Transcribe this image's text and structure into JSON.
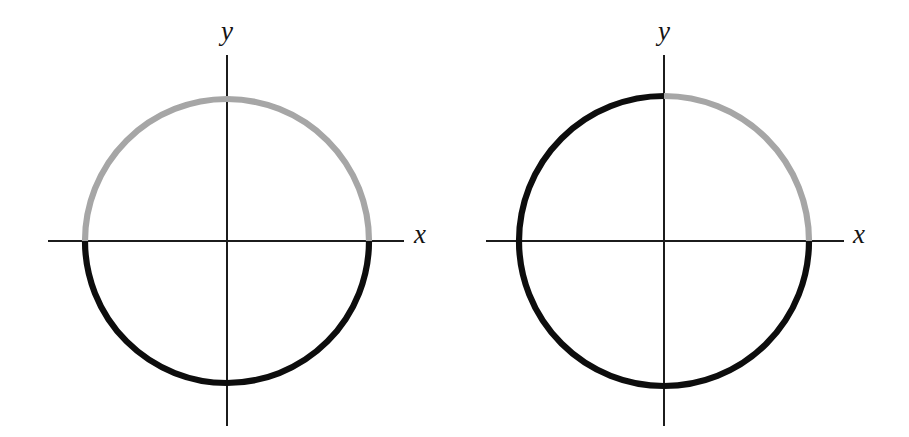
{
  "figure": {
    "background_color": "#ffffff",
    "width": 909,
    "height": 437,
    "stroke_colors": {
      "black_arc": "#0d0d0d",
      "gray_arc": "#a6a6a6",
      "axis": "#1c1c1c"
    },
    "arc_stroke_width": 6.2,
    "axis_stroke_width": 1.6
  },
  "chart_data": {
    "type": "line",
    "title": "",
    "xlabel": "x",
    "ylabel": "y",
    "grid": false,
    "legend": "none",
    "panels": [
      {
        "id": "left-panel",
        "name": "left-circle-diagram",
        "center": {
          "x": 227,
          "y": 241
        },
        "radius_x": 142,
        "radius_y": 142,
        "x_axis": {
          "x_start": 48,
          "x_end": 404,
          "y": 241
        },
        "y_axis": {
          "y_start": 55,
          "y_end": 426,
          "x": 227
        },
        "axis_labels": {
          "x": "x",
          "y": "y"
        },
        "x_label_pos": {
          "x": 414,
          "y": 233
        },
        "y_label_pos": {
          "x": 219,
          "y": 22
        },
        "arcs": [
          {
            "name": "gray-arc",
            "color": "#a6a6a6",
            "start_angle_deg": 0,
            "end_angle_deg": 180,
            "sweep_deg": 180,
            "description": "upper half of the circle, from (r,0) counterclockwise to (-r,0)"
          },
          {
            "name": "black-arc",
            "color": "#0d0d0d",
            "start_angle_deg": 180,
            "end_angle_deg": 360,
            "sweep_deg": 180,
            "description": "lower half of the circle, from (-r,0) counterclockwise to (r,0)"
          }
        ]
      },
      {
        "id": "right-panel",
        "name": "right-circle-diagram",
        "center": {
          "x": 664,
          "y": 241
        },
        "radius_x": 145,
        "radius_y": 145,
        "x_axis": {
          "x_start": 486,
          "x_end": 844,
          "y": 241
        },
        "y_axis": {
          "y_start": 55,
          "y_end": 426,
          "x": 664
        },
        "axis_labels": {
          "x": "x",
          "y": "y"
        },
        "x_label_pos": {
          "x": 853,
          "y": 233
        },
        "y_label_pos": {
          "x": 656,
          "y": 22
        },
        "arcs": [
          {
            "name": "gray-arc",
            "color": "#a6a6a6",
            "start_angle_deg": 0,
            "end_angle_deg": 90,
            "sweep_deg": 90,
            "description": "first quadrant arc, from (r,0) counterclockwise to (0,r)"
          },
          {
            "name": "black-arc",
            "color": "#0d0d0d",
            "start_angle_deg": 90,
            "end_angle_deg": 360,
            "sweep_deg": 270,
            "description": "remaining three quadrants, from (0,r) counterclockwise to (r,0)"
          }
        ]
      }
    ]
  }
}
